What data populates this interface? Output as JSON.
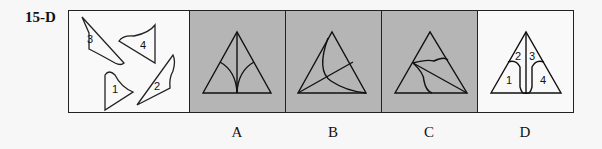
{
  "question": {
    "id": "15-D"
  },
  "pieces": {
    "labels": [
      "1",
      "2",
      "3",
      "4"
    ]
  },
  "options": [
    {
      "label": "A",
      "background": "#b5b5b5"
    },
    {
      "label": "B",
      "background": "#b5b5b5"
    },
    {
      "label": "C",
      "background": "#b5b5b5"
    },
    {
      "label": "D",
      "background": "#f9f9f9",
      "regions": [
        "1",
        "2",
        "3",
        "4"
      ]
    }
  ]
}
